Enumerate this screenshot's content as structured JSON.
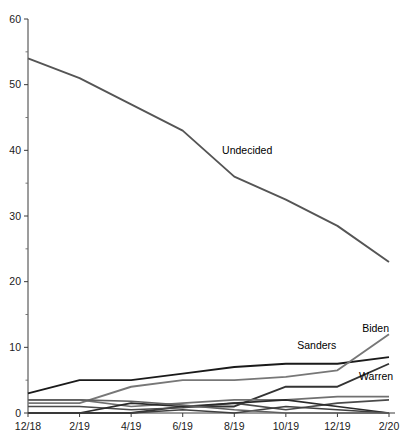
{
  "chart_data": {
    "type": "line",
    "title": "",
    "xlabel": "",
    "ylabel": "",
    "xlim": [
      0,
      7
    ],
    "ylim": [
      0,
      60
    ],
    "grid": false,
    "legend_position": "inline-labels",
    "x": [
      "12/18",
      "2/19",
      "4/19",
      "6/19",
      "8/19",
      "10/19",
      "12/19",
      "2/20"
    ],
    "categories": [
      "12/18",
      "2/19",
      "4/19",
      "6/19",
      "8/19",
      "10/19",
      "12/19",
      "2/20"
    ],
    "x_tick_labels": [
      "12/18",
      "2/19",
      "4/19",
      "6/19",
      "8/19",
      "10/19",
      "12/19",
      "2/20"
    ],
    "y_tick_labels": [
      "0",
      "10",
      "20",
      "30",
      "40",
      "50",
      "60"
    ],
    "y_ticks": [
      0,
      10,
      20,
      30,
      40,
      50,
      60
    ],
    "y_minor_ticks": [
      5,
      15,
      25,
      35,
      45,
      55
    ],
    "annotations": [
      {
        "text": "Undecided",
        "x": 4.25,
        "y": 39.5
      },
      {
        "text": "Sanders",
        "x": 5.6,
        "y": 9.7
      },
      {
        "text": "Biden",
        "x": 7.0,
        "y": 12.4
      },
      {
        "text": "Warren",
        "x": 6.75,
        "y": 5.0
      }
    ],
    "series": [
      {
        "name": "Undecided",
        "color": "#555555",
        "width": 1.9,
        "values": [
          54.0,
          51.0,
          47.0,
          43.0,
          36.0,
          32.5,
          28.5,
          23.0
        ]
      },
      {
        "name": "Sanders",
        "color": "#1a1a1a",
        "width": 1.9,
        "values": [
          3.0,
          5.0,
          5.0,
          6.0,
          7.0,
          7.5,
          7.5,
          8.5
        ]
      },
      {
        "name": "Biden",
        "color": "#777777",
        "width": 1.9,
        "values": [
          1.5,
          1.5,
          4.0,
          5.0,
          5.0,
          5.5,
          6.5,
          12.0
        ]
      },
      {
        "name": "Warren",
        "color": "#333333",
        "width": 1.9,
        "values": [
          0.0,
          0.0,
          0.0,
          1.0,
          1.0,
          4.0,
          4.0,
          7.5
        ]
      },
      {
        "name": "series-5",
        "color": "#707070",
        "width": 1.6,
        "values": [
          2.0,
          2.0,
          1.0,
          1.5,
          2.0,
          2.0,
          2.5,
          2.5
        ]
      },
      {
        "name": "series-6",
        "color": "#4a4a4a",
        "width": 1.6,
        "values": [
          1.0,
          1.0,
          0.5,
          0.8,
          1.5,
          0.5,
          1.5,
          2.0
        ]
      },
      {
        "name": "series-7",
        "color": "#2a2a2a",
        "width": 1.6,
        "values": [
          0.0,
          0.0,
          1.5,
          1.0,
          1.5,
          2.0,
          1.0,
          0.0
        ]
      },
      {
        "name": "series-8",
        "color": "#3f3f3f",
        "width": 1.6,
        "values": [
          0.0,
          0.0,
          0.0,
          0.5,
          0.0,
          1.0,
          0.5,
          0.0
        ]
      },
      {
        "name": "series-9",
        "color": "#606060",
        "width": 1.6,
        "values": [
          2.0,
          2.0,
          1.8,
          1.2,
          0.5,
          0.0,
          0.0,
          0.0
        ]
      }
    ]
  },
  "axes": {
    "y_axis_name": "y-axis",
    "x_axis_name": "x-axis"
  }
}
